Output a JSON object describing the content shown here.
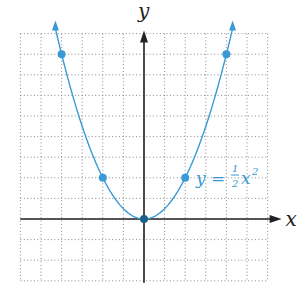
{
  "chart_data": {
    "type": "line",
    "title": "",
    "xlabel": "x",
    "ylabel": "y",
    "xlim": [
      -6,
      6
    ],
    "ylim": [
      -3,
      9
    ],
    "grid": true,
    "grid_style": "dotted",
    "series": [
      {
        "name": "y = 1/2 x^2",
        "function": "0.5*x^2",
        "color": "#3a9ad6",
        "points": [
          {
            "x": -4,
            "y": 8
          },
          {
            "x": -2,
            "y": 2
          },
          {
            "x": 0,
            "y": 0
          },
          {
            "x": 2,
            "y": 2
          },
          {
            "x": 4,
            "y": 8
          }
        ]
      }
    ],
    "annotations": [
      {
        "text": "y = ½x²",
        "x": 2.5,
        "y": 2.5
      }
    ]
  },
  "labels": {
    "x_axis": "x",
    "y_axis": "y",
    "equation_lhs": "y =",
    "equation_num": "1",
    "equation_den": "2",
    "equation_var": "x",
    "equation_exp": "2"
  },
  "colors": {
    "curve": "#3a9ad6",
    "axis": "#222222",
    "grid": "#8a8a8a",
    "origin_dot": "#1d5f8a"
  }
}
